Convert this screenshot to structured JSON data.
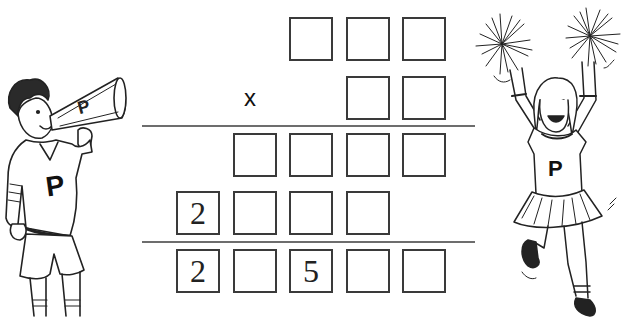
{
  "puzzle": {
    "type": "long-multiplication cryptarithm",
    "operator": "x",
    "rows": [
      {
        "name": "multiplicand",
        "digits": [
          "",
          "",
          ""
        ]
      },
      {
        "name": "multiplier",
        "digits": [
          "",
          ""
        ]
      },
      {
        "name": "partial-product-1",
        "digits": [
          "",
          "",
          "",
          ""
        ]
      },
      {
        "name": "partial-product-2",
        "digits": [
          "2",
          "",
          "",
          ""
        ]
      },
      {
        "name": "result",
        "digits": [
          "2",
          "",
          "5",
          "",
          ""
        ]
      }
    ]
  },
  "illustrations": {
    "left": {
      "label": "cheerleader-with-megaphone",
      "letter": "P"
    },
    "right": {
      "label": "cheerleader-with-pompoms",
      "letter": "P"
    }
  },
  "colors": {
    "box_border": "#3a3a3a",
    "rule_line": "#6d6d6d",
    "background": "#ffffff"
  }
}
